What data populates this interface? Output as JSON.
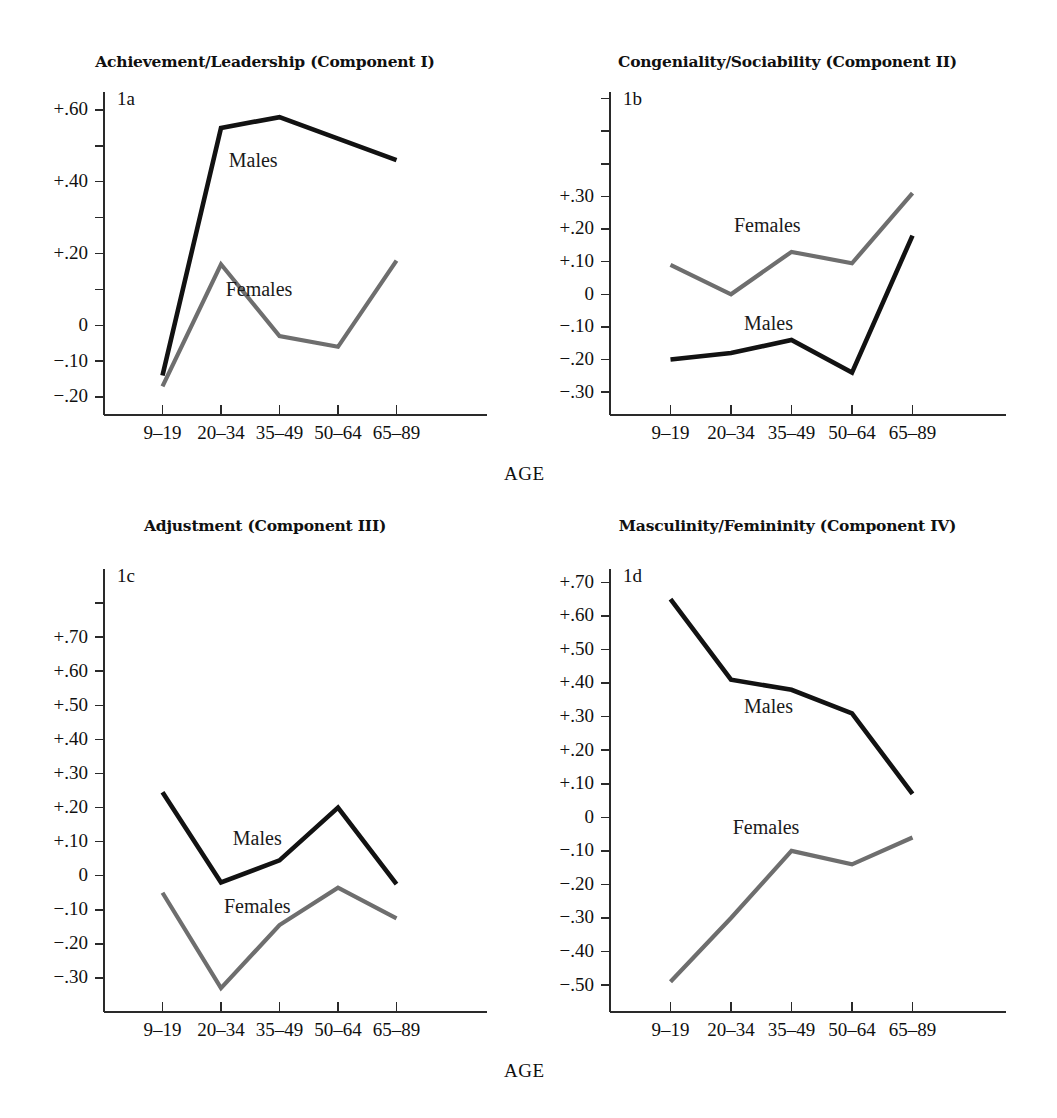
{
  "figure": {
    "background": "#ffffff",
    "series_colors": {
      "Males": "#121212",
      "Females": "#6e6e6e"
    },
    "age_caption_top": "AGE",
    "age_caption_bottom": "AGE"
  },
  "chart_data": [
    {
      "type": "line",
      "panel_tag": "1a",
      "title": "Achievement/Leadership (Component I)",
      "xlabel": "AGE",
      "ylabel": "",
      "categories": [
        "9–19",
        "20–34",
        "35–49",
        "50–64",
        "65–89"
      ],
      "ylim": [
        -0.25,
        0.65
      ],
      "ytick_values": [
        0.6,
        0.5,
        0.4,
        0.3,
        0.2,
        0.1,
        0.0,
        -0.1,
        -0.2
      ],
      "ytick_labels": [
        "+.60",
        "",
        "+.40",
        "",
        "+.20",
        "",
        "0",
        "−.10",
        "−.20"
      ],
      "grid": false,
      "legend": "inline-labels",
      "series": [
        {
          "name": "Males",
          "values": [
            -0.14,
            0.55,
            0.58,
            0.52,
            0.46
          ],
          "label_at": {
            "x": 1.55,
            "y": 0.455
          }
        },
        {
          "name": "Females",
          "values": [
            -0.17,
            0.17,
            -0.03,
            -0.06,
            0.18
          ],
          "label_at": {
            "x": 1.65,
            "y": 0.095
          }
        }
      ]
    },
    {
      "type": "line",
      "panel_tag": "1b",
      "title": "Congeniality/Sociability (Component II)",
      "xlabel": "AGE",
      "ylabel": "",
      "categories": [
        "9–19",
        "20–34",
        "35–49",
        "50–64",
        "65–89"
      ],
      "ylim": [
        -0.37,
        0.62
      ],
      "ytick_values": [
        0.6,
        0.5,
        0.4,
        0.3,
        0.2,
        0.1,
        0.0,
        -0.1,
        -0.2,
        -0.3
      ],
      "ytick_labels": [
        "",
        "",
        "",
        "+.30",
        "+.20",
        "+.10",
        "0",
        "−.10",
        "−.20",
        "−.30"
      ],
      "grid": false,
      "legend": "inline-labels",
      "series": [
        {
          "name": "Males",
          "values": [
            -0.2,
            -0.18,
            -0.14,
            -0.24,
            0.18
          ],
          "label_at": {
            "x": 1.62,
            "y": -0.095
          }
        },
        {
          "name": "Females",
          "values": [
            0.09,
            0.0,
            0.13,
            0.095,
            0.31
          ],
          "label_at": {
            "x": 1.6,
            "y": 0.205
          }
        }
      ]
    },
    {
      "type": "line",
      "panel_tag": "1c",
      "title": "Adjustment (Component III)",
      "xlabel": "AGE",
      "ylabel": "",
      "categories": [
        "9–19",
        "20–34",
        "35–49",
        "50–64",
        "65–89"
      ],
      "ylim": [
        -0.4,
        0.9
      ],
      "ytick_values": [
        0.8,
        0.7,
        0.6,
        0.5,
        0.4,
        0.3,
        0.2,
        0.1,
        0.0,
        -0.1,
        -0.2,
        -0.3
      ],
      "ytick_labels": [
        "",
        "+.70",
        "+.60",
        "+.50",
        "+.40",
        "+.30",
        "+.20",
        "+.10",
        "0",
        "−.10",
        "−.20",
        "−.30"
      ],
      "grid": false,
      "legend": "inline-labels",
      "series": [
        {
          "name": "Males",
          "values": [
            0.245,
            -0.02,
            0.045,
            0.2,
            -0.025
          ],
          "label_at": {
            "x": 1.62,
            "y": 0.105
          }
        },
        {
          "name": "Females",
          "values": [
            -0.05,
            -0.33,
            -0.145,
            -0.035,
            -0.125
          ],
          "label_at": {
            "x": 1.62,
            "y": -0.095
          }
        }
      ]
    },
    {
      "type": "line",
      "panel_tag": "1d",
      "title": "Masculinity/Femininity (Component IV)",
      "xlabel": "AGE",
      "ylabel": "",
      "categories": [
        "9–19",
        "20–34",
        "35–49",
        "50–64",
        "65–89"
      ],
      "ylim": [
        -0.58,
        0.74
      ],
      "ytick_values": [
        0.7,
        0.6,
        0.5,
        0.4,
        0.3,
        0.2,
        0.1,
        0.0,
        -0.1,
        -0.2,
        -0.3,
        -0.4,
        -0.5
      ],
      "ytick_labels": [
        "+.70",
        "+.60",
        "+.50",
        "+.40",
        "+.30",
        "+.20",
        "+.10",
        "0",
        "−.10",
        "−.20",
        "−.30",
        "−.40",
        "−.50"
      ],
      "grid": false,
      "legend": "inline-labels",
      "series": [
        {
          "name": "Males",
          "values": [
            0.65,
            0.41,
            0.38,
            0.31,
            0.07
          ],
          "label_at": {
            "x": 1.62,
            "y": 0.325
          }
        },
        {
          "name": "Females",
          "values": [
            -0.49,
            -0.3,
            -0.1,
            -0.14,
            -0.06
          ],
          "label_at": {
            "x": 1.58,
            "y": -0.035
          }
        }
      ]
    }
  ]
}
